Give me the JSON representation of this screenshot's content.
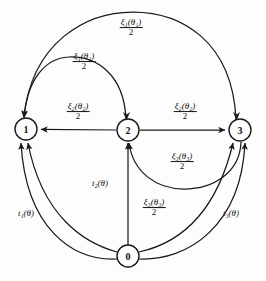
{
  "diagram": {
    "background": "#fdfdfd",
    "stroke_color": "#1a1a1a",
    "nodes": [
      {
        "id": "n1",
        "label": "1",
        "x": 26,
        "y": 129,
        "r": 11
      },
      {
        "id": "n2",
        "label": "2",
        "x": 128,
        "y": 130,
        "r": 11
      },
      {
        "id": "n3",
        "label": "3",
        "x": 240,
        "y": 130,
        "r": 11
      },
      {
        "id": "n0",
        "label": "0",
        "x": 128,
        "y": 256,
        "r": 11
      }
    ],
    "edges": [
      {
        "id": "e-3-1-outer",
        "from": "3",
        "to": "1",
        "shape": "arc-top-outer",
        "label_numerator": "ξ₁(θ₁)",
        "label_denominator": "2",
        "label_x": 131,
        "label_y": 28
      },
      {
        "id": "e-2-1-inner",
        "from": "2",
        "to": "1",
        "shape": "arc-top-inner",
        "label_numerator": "ξ₁(θ₁)",
        "label_denominator": "2",
        "label_x": 84,
        "label_y": 62
      },
      {
        "id": "e-2-1-straight",
        "from": "2",
        "to": "1",
        "shape": "straight-left",
        "label_numerator": "ξ₂(θ₂)",
        "label_denominator": "2",
        "label_x": 78,
        "label_y": 112
      },
      {
        "id": "e-2-3-straight",
        "from": "2",
        "to": "3",
        "shape": "straight-right",
        "label_numerator": "ξ₂(θ₂)",
        "label_denominator": "2",
        "label_x": 185,
        "label_y": 112
      },
      {
        "id": "e-3-2-lower",
        "from": "3",
        "to": "2",
        "shape": "arc-lower-mid",
        "label_numerator": "ξ₃(θ₃)",
        "label_denominator": "2",
        "label_x": 182,
        "label_y": 162
      },
      {
        "id": "e-0-3-inner",
        "from": "0",
        "to": "3",
        "shape": "arc-bottom-inner",
        "label_numerator": "ξ₃(θ₃)",
        "label_denominator": "2",
        "label_x": 154,
        "label_y": 208
      },
      {
        "id": "e-0-2",
        "from": "0",
        "to": "2",
        "shape": "vertical",
        "label_plain": "t₂(θ)",
        "label_x": 100,
        "label_y": 184
      },
      {
        "id": "e-0-1",
        "from": "0",
        "to": "1",
        "shape": "arc-bottom-left",
        "label_plain": "t₁(θ)",
        "label_x": 26,
        "label_y": 214
      },
      {
        "id": "e-0-3-outer",
        "from": "0",
        "to": "3",
        "shape": "arc-bottom-right",
        "label_plain": "t₃(θ)",
        "label_x": 231,
        "label_y": 214
      }
    ]
  }
}
